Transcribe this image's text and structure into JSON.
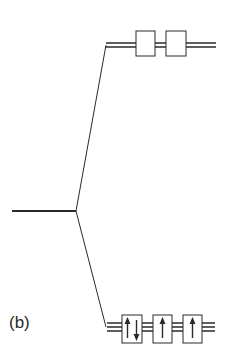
{
  "figure": {
    "panel_label": "(b)",
    "colors": {
      "line": "#2a2a2a",
      "background": "#ffffff"
    }
  },
  "levels": {
    "degenerate": {
      "name": "free-ion d level",
      "x1": 12,
      "x2": 76,
      "y": 211
    },
    "upper": {
      "name": "upper split level (e set)",
      "orbitals": 2,
      "electrons": [
        0,
        0
      ],
      "line_ys": [
        43,
        47
      ]
    },
    "lower": {
      "name": "lower split level (t2 set)",
      "orbitals": 3,
      "electrons": [
        "up-down",
        "up",
        "up"
      ],
      "line_ys": [
        323,
        327,
        331
      ]
    }
  }
}
